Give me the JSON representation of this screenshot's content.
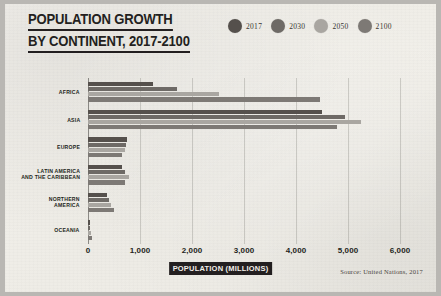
{
  "title": {
    "line1": "POPULATION GROWTH",
    "line2": "BY CONTINENT, 2017-2100"
  },
  "legend": {
    "position": "top-right",
    "items": [
      {
        "label": "2017",
        "color": "#55504c"
      },
      {
        "label": "2030",
        "color": "#6e6a66"
      },
      {
        "label": "2050",
        "color": "#a9a6a1"
      },
      {
        "label": "2100",
        "color": "#7d7975"
      }
    ]
  },
  "axis_title": "POPULATION (MILLIONS)",
  "source": "Source: United Nations, 2017",
  "chart_data": {
    "type": "bar",
    "orientation": "horizontal",
    "title": "POPULATION GROWTH BY CONTINENT, 2017-2100",
    "xlabel": "POPULATION (MILLIONS)",
    "ylabel": "",
    "xlim": [
      0,
      6000
    ],
    "xticks": [
      0,
      1000,
      2000,
      3000,
      4000,
      5000,
      6000
    ],
    "xtick_labels": [
      "0",
      "1,000",
      "2,000",
      "3,000",
      "4,000",
      "5,000",
      "6,000"
    ],
    "grid": true,
    "legend_position": "top-right",
    "categories": [
      "AFRICA",
      "ASIA",
      "EUROPE",
      "LATIN AMERICA AND THE CARIBBEAN",
      "NORTHERN AMERICA",
      "OCEANIA"
    ],
    "category_lines": [
      [
        "AFRICA"
      ],
      [
        "ASIA"
      ],
      [
        "EUROPE"
      ],
      [
        "LATIN AMERICA",
        "AND THE CARIBBEAN"
      ],
      [
        "NORTHERN",
        "AMERICA"
      ],
      [
        "OCEANIA"
      ]
    ],
    "series": [
      {
        "name": "2017",
        "color": "#55504c",
        "values": [
          1256,
          4504,
          742,
          646,
          361,
          41
        ]
      },
      {
        "name": "2030",
        "color": "#6e6a66",
        "values": [
          1704,
          4947,
          739,
          718,
          395,
          48
        ]
      },
      {
        "name": "2050",
        "color": "#a9a6a1",
        "values": [
          2528,
          5257,
          716,
          780,
          435,
          57
        ]
      },
      {
        "name": "2100",
        "color": "#7d7975",
        "values": [
          4468,
          4780,
          653,
          712,
          499,
          72
        ]
      }
    ]
  }
}
